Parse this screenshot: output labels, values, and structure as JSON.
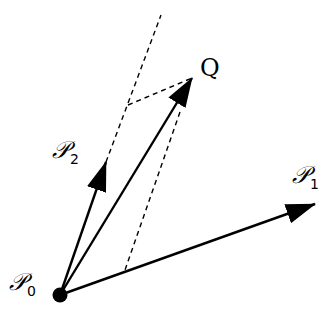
{
  "diagram": {
    "colors": {
      "stroke": "#000000",
      "background": "#ffffff"
    },
    "origin": {
      "name": "P0",
      "x": 60,
      "y": 295,
      "radius": 7
    },
    "vectors": [
      {
        "id": "p1",
        "label": "P1",
        "from": [
          60,
          295
        ],
        "to": [
          315,
          204
        ],
        "style": "solid-arrow"
      },
      {
        "id": "p2",
        "label": "P2",
        "from": [
          60,
          295
        ],
        "to": [
          106,
          162
        ],
        "style": "solid-arrow"
      },
      {
        "id": "q",
        "label": "Q",
        "from": [
          60,
          295
        ],
        "to": [
          192,
          78
        ],
        "style": "solid-arrow"
      }
    ],
    "dashed_lines": [
      {
        "id": "p2-extension",
        "from": [
          106,
          162
        ],
        "to": [
          161,
          15
        ]
      },
      {
        "id": "q-parallel-p1",
        "from": [
          128,
          105
        ],
        "to": [
          192,
          78
        ]
      },
      {
        "id": "q-parallel-p2",
        "from": [
          192,
          78
        ],
        "to": [
          125,
          270
        ]
      }
    ],
    "labels": {
      "p0": {
        "main": "𝒫",
        "sub": "0"
      },
      "p1": {
        "main": "𝒫",
        "sub": "1"
      },
      "p2": {
        "main": "𝒫",
        "sub": "2"
      },
      "q": {
        "main": "Q"
      }
    }
  }
}
